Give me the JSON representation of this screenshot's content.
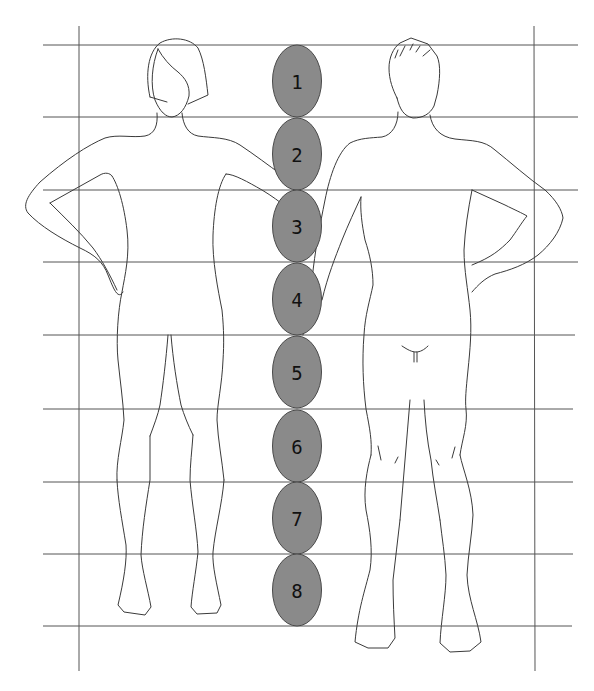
{
  "diagram": {
    "colors": {
      "background": "#ffffff",
      "grid": "#555555",
      "outline": "#3a3a3a",
      "oval_fill": "#8a8a8a",
      "oval_stroke": "#4a4a4a",
      "label": "#111111"
    },
    "grid": {
      "horizontal_lines_y": [
        45,
        117,
        190,
        262,
        335,
        409,
        482,
        554,
        626
      ],
      "vertical_lines_x": [
        79,
        534
      ]
    },
    "head_units": [
      {
        "label": "1",
        "cy": 81
      },
      {
        "label": "2",
        "cy": 154
      },
      {
        "label": "3",
        "cy": 226
      },
      {
        "label": "4",
        "cy": 299
      },
      {
        "label": "5",
        "cy": 372
      },
      {
        "label": "6",
        "cy": 446
      },
      {
        "label": "7",
        "cy": 518
      },
      {
        "label": "8",
        "cy": 590
      }
    ],
    "figures": [
      {
        "name": "female-figure",
        "position": "left"
      },
      {
        "name": "male-figure",
        "position": "right"
      }
    ]
  }
}
